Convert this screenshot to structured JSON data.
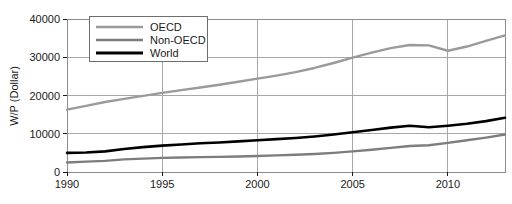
{
  "chart_data": {
    "type": "line",
    "title": "",
    "xlabel": "",
    "ylabel": "W/P (Dollar)",
    "xlim": [
      1990,
      2013
    ],
    "ylim": [
      0,
      40000
    ],
    "grid": true,
    "legend_position": "top-left",
    "x_ticks": [
      "1990",
      "1995",
      "2000",
      "2005",
      "2010"
    ],
    "x_tick_values": [
      1990,
      1995,
      2000,
      2005,
      2010
    ],
    "y_ticks": [
      "0",
      "10000",
      "20000",
      "30000",
      "40000"
    ],
    "y_tick_values": [
      0,
      10000,
      20000,
      30000,
      40000
    ],
    "x": [
      1990,
      1991,
      1992,
      1993,
      1994,
      1995,
      1996,
      1997,
      1998,
      1999,
      2000,
      2001,
      2002,
      2003,
      2004,
      2005,
      2006,
      2007,
      2008,
      2009,
      2010,
      2011,
      2012,
      2013
    ],
    "series": [
      {
        "name": "OECD",
        "color": "#9a9a9a",
        "width": 2.4,
        "values": [
          16300,
          17300,
          18300,
          19100,
          19900,
          20700,
          21400,
          22100,
          22800,
          23600,
          24400,
          25200,
          26100,
          27200,
          28500,
          29900,
          31200,
          32400,
          33200,
          33100,
          31700,
          32800,
          34300,
          35700
        ]
      },
      {
        "name": "Non-OECD",
        "color": "#7d7d7d",
        "width": 2.4,
        "values": [
          2500,
          2700,
          2900,
          3300,
          3500,
          3700,
          3800,
          3900,
          3950,
          4050,
          4200,
          4350,
          4500,
          4700,
          5000,
          5400,
          5800,
          6300,
          6800,
          7000,
          7600,
          8300,
          9000,
          9800
        ]
      },
      {
        "name": "World",
        "color": "#000000",
        "width": 2.6,
        "values": [
          5000,
          5100,
          5400,
          6000,
          6500,
          6900,
          7200,
          7500,
          7700,
          8000,
          8300,
          8600,
          8900,
          9300,
          9800,
          10400,
          11000,
          11600,
          12100,
          11700,
          12100,
          12600,
          13300,
          14200
        ]
      }
    ],
    "legend_entries": [
      {
        "label": "OECD",
        "color": "#9a9a9a"
      },
      {
        "label": "Non-OECD",
        "color": "#7d7d7d"
      },
      {
        "label": "World",
        "color": "#000000"
      }
    ]
  }
}
